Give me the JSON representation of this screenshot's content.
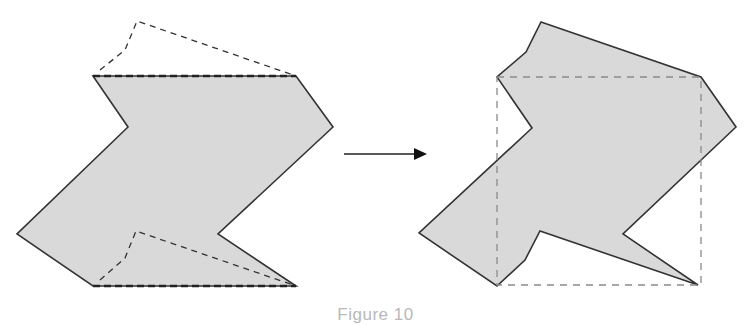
{
  "figure": {
    "caption": "Figure 10",
    "colors": {
      "background": "#ffffff",
      "shape_fill": "#d9d9d9",
      "shape_stroke": "#333333",
      "left_dashed_stroke": "#333333",
      "right_dashed_stroke": "#8a8a8a",
      "arrow": "#111111",
      "caption_text": "#b8b8b8"
    },
    "left_panel": {
      "label": "original-shape",
      "polygon_points": "93,76 296,76 333,127 218,234 296,286 93,286 17,234 128,127",
      "dashed_top_path": "100,70 125,50 137,21 296,76",
      "dashed_top_edge": "93,76 296,76",
      "dashed_bottom_path": "100,280 125,258 136,231 296,286",
      "dashed_bottom_edge": "93,286 296,286"
    },
    "arrow": {
      "x1": 344,
      "y1": 154,
      "x2": 416,
      "y2": 154,
      "head_points": "414,148 427,154 414,160"
    },
    "right_panel": {
      "label": "transformed-shape",
      "polygon_points": "541,22 701,77 736,127 623,234 698,285 540,231 525,260 497,286 419,233 532,128 497,77 526,52",
      "dashed_rect": {
        "x": 497,
        "y": 77,
        "width": 204,
        "height": 208
      }
    }
  }
}
